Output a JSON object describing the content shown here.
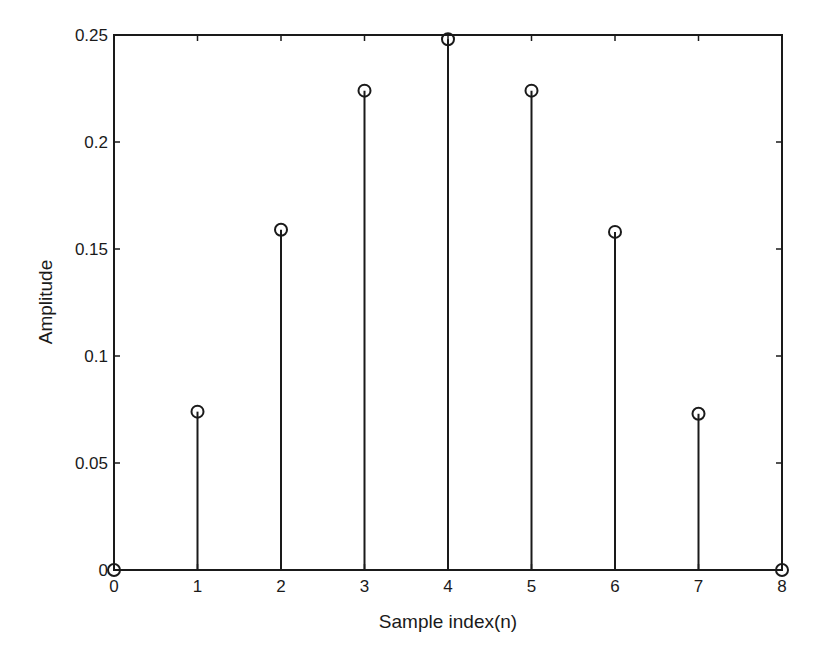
{
  "chart_data": {
    "type": "stem",
    "title": "",
    "xlabel": "Sample index(n)",
    "ylabel": "Amplitude",
    "x": [
      0,
      1,
      2,
      3,
      4,
      5,
      6,
      7,
      8
    ],
    "values": [
      0,
      0.074,
      0.159,
      0.224,
      0.248,
      0.224,
      0.158,
      0.073,
      0
    ],
    "xlim": [
      0,
      8
    ],
    "ylim": [
      0,
      0.25
    ],
    "xticks": [
      0,
      1,
      2,
      3,
      4,
      5,
      6,
      7,
      8
    ],
    "xtick_labels": [
      "0",
      "1",
      "2",
      "3",
      "4",
      "5",
      "6",
      "7",
      "8"
    ],
    "yticks": [
      0,
      0.05,
      0.1,
      0.15,
      0.2,
      0.25
    ],
    "ytick_labels": [
      "0",
      "0.05",
      "0.1",
      "0.15",
      "0.2",
      "0.25"
    ],
    "grid": false,
    "legend": null,
    "marker": "open-circle",
    "line_color": "#1a1a1a"
  }
}
